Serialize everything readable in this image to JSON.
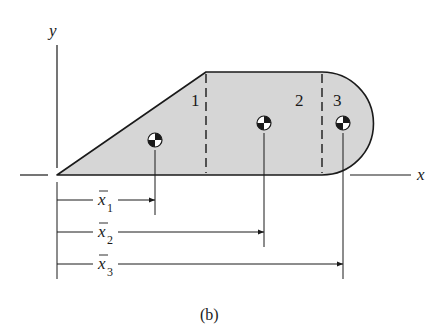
{
  "figure": {
    "caption": "(b)",
    "axes": {
      "x_label": "x",
      "y_label": "y"
    },
    "fill_color": "#d6d6d6",
    "stroke_color": "#1a1a1a",
    "parts": [
      {
        "id": "1",
        "label": "1",
        "shape": "triangle"
      },
      {
        "id": "2",
        "label": "2",
        "shape": "rectangle"
      },
      {
        "id": "3",
        "label": "3",
        "shape": "semicircle"
      }
    ],
    "dimensions": [
      {
        "symbol": "x",
        "subscript": "1"
      },
      {
        "symbol": "x",
        "subscript": "2"
      },
      {
        "symbol": "x",
        "subscript": "3"
      }
    ]
  }
}
